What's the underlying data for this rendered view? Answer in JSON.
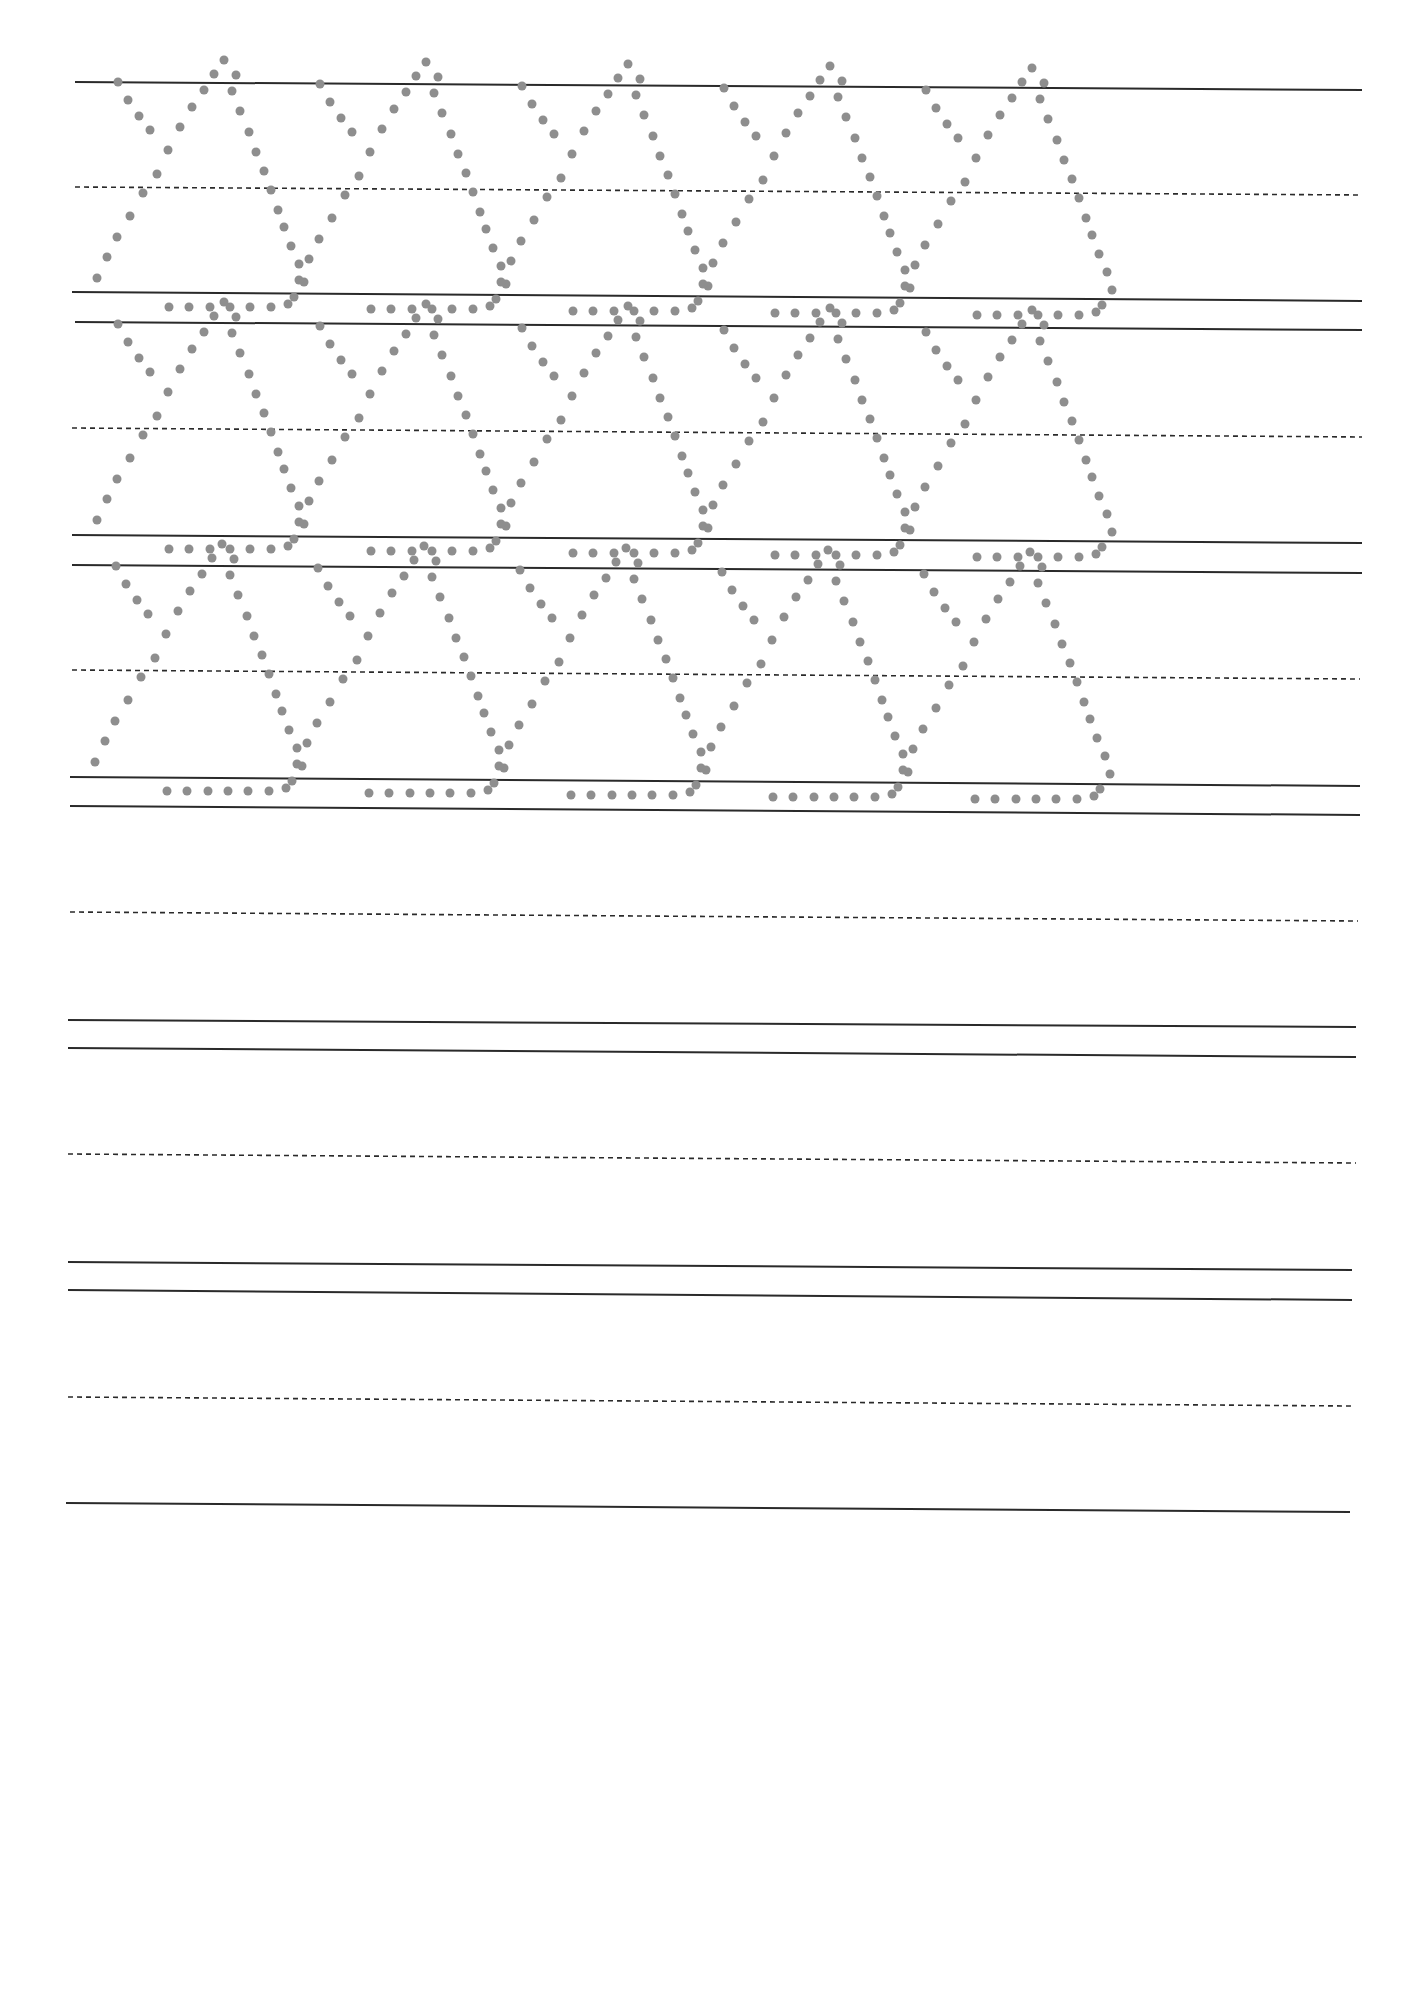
{
  "page": {
    "type": "handwriting-practice-worksheet",
    "width": 1422,
    "height": 1990,
    "background": "#ffffff",
    "line_color": "#2a2a2a",
    "dash_color": "#2a2a2a",
    "dot_color": "#8e8e8e"
  },
  "rows": [
    {
      "top": [
        75,
        82,
        1362,
        90
      ],
      "mid": [
        75,
        187,
        1362,
        195
      ],
      "base": [
        72,
        292,
        1362,
        301
      ],
      "traced": true
    },
    {
      "top": [
        75,
        322,
        1362,
        330
      ],
      "mid": [
        72,
        428,
        1362,
        437
      ],
      "base": [
        72,
        535,
        1362,
        543
      ],
      "traced": true
    },
    {
      "top": [
        72,
        565,
        1362,
        573
      ],
      "mid": [
        72,
        670,
        1360,
        679
      ],
      "base": [
        70,
        777,
        1360,
        786
      ],
      "traced": true
    },
    {
      "top": [
        70,
        806,
        1360,
        815
      ],
      "mid": [
        70,
        912,
        1358,
        921
      ],
      "base": [
        68,
        1020,
        1356,
        1027
      ],
      "traced": false
    },
    {
      "top": [
        68,
        1048,
        1356,
        1057
      ],
      "mid": [
        68,
        1154,
        1356,
        1163
      ],
      "base": [
        68,
        1262,
        1352,
        1270
      ],
      "traced": false
    },
    {
      "top": [
        68,
        1290,
        1352,
        1300
      ],
      "mid": [
        68,
        1397,
        1352,
        1406
      ],
      "base": [
        66,
        1503,
        1350,
        1512
      ],
      "traced": false
    }
  ],
  "glyph": {
    "name": "dotted-letter",
    "dot_radius": 4.5,
    "width": 200,
    "height": 230,
    "dots": [
      [
        58,
        50
      ],
      [
        68,
        68
      ],
      [
        79,
        84
      ],
      [
        90,
        98
      ],
      [
        37,
        246
      ],
      [
        47,
        225
      ],
      [
        57,
        205
      ],
      [
        70,
        184
      ],
      [
        83,
        161
      ],
      [
        97,
        142
      ],
      [
        108,
        118
      ],
      [
        120,
        95
      ],
      [
        132,
        75
      ],
      [
        144,
        58
      ],
      [
        154,
        42
      ],
      [
        164,
        28
      ],
      [
        172,
        59
      ],
      [
        180,
        79
      ],
      [
        189,
        100
      ],
      [
        196,
        120
      ],
      [
        204,
        139
      ],
      [
        211,
        158
      ],
      [
        218,
        178
      ],
      [
        224,
        195
      ],
      [
        231,
        214
      ],
      [
        239,
        232
      ],
      [
        244,
        250
      ],
      [
        234,
        265
      ],
      [
        176,
        43
      ],
      [
        109,
        275
      ],
      [
        129,
        275
      ],
      [
        150,
        275
      ],
      [
        170,
        275
      ],
      [
        190,
        275
      ],
      [
        211,
        275
      ],
      [
        228,
        272
      ]
    ]
  },
  "traced_glyph_offsets_x": [
    0,
    200,
    400,
    600,
    800
  ],
  "row_glyph_anchor": [
    {
      "x": 60,
      "y": 32
    },
    {
      "x": 60,
      "y": 274
    },
    {
      "x": 58,
      "y": 516
    }
  ]
}
